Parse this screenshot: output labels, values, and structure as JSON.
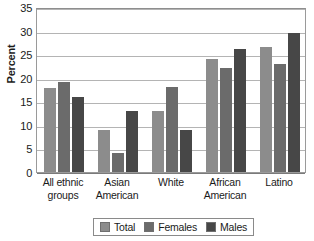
{
  "chart_data": {
    "type": "bar",
    "title": "",
    "xlabel": "",
    "ylabel": "Percent",
    "ylim": [
      0,
      35
    ],
    "ytick_step": 5,
    "yticks": [
      35,
      30,
      25,
      20,
      15,
      10,
      5,
      0
    ],
    "grid": true,
    "legend_position": "bottom-center",
    "categories": [
      "All ethnic groups",
      "Asian American",
      "White",
      "African American",
      "Latino"
    ],
    "category_lines": [
      [
        "All ethnic",
        "groups"
      ],
      [
        "Asian",
        "American"
      ],
      [
        "White"
      ],
      [
        "African",
        "American"
      ],
      [
        "Latino"
      ]
    ],
    "series": [
      {
        "name": "Total",
        "color": "#8c8c8c",
        "values": [
          17.8,
          9.0,
          13.0,
          24.0,
          26.5
        ]
      },
      {
        "name": "Females",
        "color": "#6b6b6b",
        "values": [
          19.0,
          4.0,
          18.0,
          22.0,
          23.0
        ]
      },
      {
        "name": "Males",
        "color": "#474747",
        "values": [
          16.0,
          13.0,
          9.0,
          26.0,
          29.5
        ]
      }
    ]
  },
  "colors": {
    "total": "#8c8c8c",
    "females": "#6b6b6b",
    "males": "#474747",
    "gridline": "#b4b4b4",
    "axis": "#9a9a9a",
    "text": "#1a1a1a"
  }
}
